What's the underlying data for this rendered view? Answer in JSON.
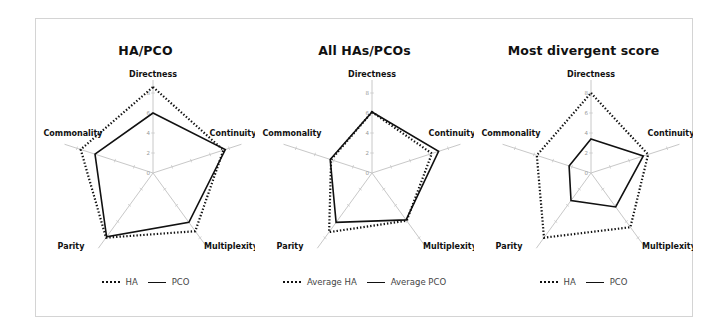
{
  "figure": {
    "frame_color": "#d4d4d4",
    "series_color": "#111111",
    "axis_color": "#c8c8c8"
  },
  "chart_data": [
    {
      "type": "radar",
      "title": "HA/PCO",
      "axes": [
        "Directness",
        "Continuity",
        "Multiplexity",
        "Parity",
        "Commonality"
      ],
      "ticks": [
        "0",
        "2",
        "4",
        "6",
        "8"
      ],
      "range": [
        0,
        9
      ],
      "grid": false,
      "legend_position": "bottom",
      "series": [
        {
          "name": "HA",
          "style": "dotted",
          "values": [
            8.6,
            7.4,
            7.2,
            8.0,
            7.6
          ]
        },
        {
          "name": "PCO",
          "style": "solid",
          "values": [
            6.0,
            7.6,
            6.1,
            7.9,
            6.1
          ]
        }
      ]
    },
    {
      "type": "radar",
      "title": "All HAs/PCOs",
      "axes": [
        "Directness",
        "Continuity",
        "Multiplexity",
        "Parity",
        "Commonality"
      ],
      "ticks": [
        "0",
        "2",
        "4",
        "6",
        "8"
      ],
      "range": [
        0,
        9
      ],
      "grid": false,
      "legend_position": "bottom",
      "series": [
        {
          "name": "Average HA",
          "style": "dotted",
          "values": [
            6.1,
            6.3,
            5.9,
            7.3,
            4.3
          ]
        },
        {
          "name": "Average PCO",
          "style": "solid",
          "values": [
            6.1,
            7.0,
            5.8,
            6.1,
            4.4
          ]
        }
      ]
    },
    {
      "type": "radar",
      "title": "Most divergent score",
      "axes": [
        "Directness",
        "Continuity",
        "Multiplexity",
        "Parity",
        "Commonality"
      ],
      "ticks": [
        "0",
        "2",
        "4",
        "6",
        "8"
      ],
      "range": [
        0,
        9
      ],
      "grid": false,
      "legend_position": "bottom",
      "series": [
        {
          "name": "HA",
          "style": "dotted",
          "values": [
            8.0,
            6.0,
            6.7,
            8.0,
            5.7
          ]
        },
        {
          "name": "PCO",
          "style": "solid",
          "values": [
            3.4,
            5.5,
            4.2,
            3.4,
            2.3
          ]
        }
      ]
    }
  ]
}
